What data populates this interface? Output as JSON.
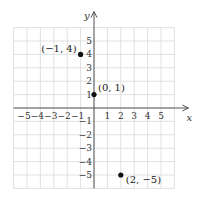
{
  "chart_data": {
    "type": "scatter",
    "title": "",
    "xlabel": "x",
    "ylabel": "y",
    "xlim": [
      -6,
      6
    ],
    "ylim": [
      -6,
      6
    ],
    "grid": true,
    "x_ticks": [
      "−5",
      "−4",
      "−3",
      "−2",
      "−1",
      "1",
      "2",
      "3",
      "4",
      "5"
    ],
    "y_ticks": [
      "5",
      "4",
      "3",
      "2",
      "1",
      "−1",
      "−2",
      "−3",
      "−4",
      "−5"
    ],
    "points": [
      {
        "x": -1,
        "y": 4,
        "label": "(−1, 4)"
      },
      {
        "x": 0,
        "y": 1,
        "label": "(0, 1)"
      },
      {
        "x": 2,
        "y": -5,
        "label": "(2, −5)"
      }
    ]
  },
  "colors": {
    "grid": "#d9d9d9",
    "axis": "#555555",
    "point": "#111111"
  }
}
